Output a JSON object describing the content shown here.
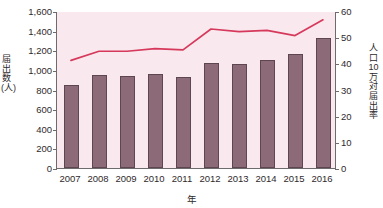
{
  "chart_data": {
    "type": "bar",
    "title": "",
    "subtitle": "",
    "xlabel": "年",
    "ylabel": "届出数(人)",
    "y2label": "人口10万対届出率",
    "categories": [
      "2007",
      "2008",
      "2009",
      "2010",
      "2011",
      "2012",
      "2013",
      "2014",
      "2015",
      "2016"
    ],
    "ylim": [
      0,
      1600
    ],
    "y2lim": [
      0,
      60
    ],
    "yticks": [
      "0",
      "200",
      "400",
      "600",
      "800",
      "1,000",
      "1,200",
      "1,400",
      "1,600"
    ],
    "ytick_values": [
      0,
      200,
      400,
      600,
      800,
      1000,
      1200,
      1400,
      1600
    ],
    "y2ticks": [
      "0",
      "10",
      "20",
      "30",
      "40",
      "50",
      "60"
    ],
    "y2tick_values": [
      0,
      10,
      20,
      30,
      40,
      50,
      60
    ],
    "grid": false,
    "legend_position": "none",
    "series": [
      {
        "name": "届出数(人)",
        "kind": "bar",
        "axis": "left",
        "color": "#8d6a78",
        "edge_color": "#5e4651",
        "values": [
          850,
          950,
          940,
          960,
          925,
          1070,
          1060,
          1100,
          1160,
          1330
        ]
      },
      {
        "name": "人口10万対届出率",
        "kind": "line",
        "axis": "right",
        "color": "#d6395b",
        "values": [
          41.5,
          45.0,
          45.0,
          46.0,
          45.5,
          53.5,
          52.5,
          53.0,
          51.0,
          57.0
        ]
      }
    ],
    "plot_background_color": "#f9e9ef",
    "axis_color": "#6f6a6c"
  }
}
